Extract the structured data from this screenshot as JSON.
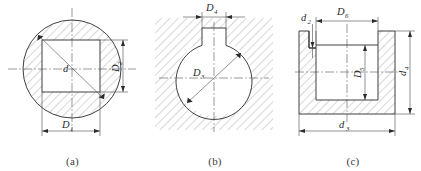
{
  "sheet": {
    "title": "Cross-sectional engineering drawings",
    "background_color": "#ffffff",
    "line_color": "#2b2b2b",
    "hatch_color": "#6e6e6e",
    "dimension_color": "#4a4a4a"
  },
  "figures": [
    {
      "id": "a",
      "caption": "(a)",
      "description": "Hatched circular section with a central square hole, centerlines crossing and a diagonal radius indicator",
      "dimensions": [
        {
          "name": "D1",
          "letter": "D",
          "subscript": "1",
          "position": "bottom",
          "measures": "square-hole-width"
        },
        {
          "name": "D2",
          "letter": "D",
          "subscript": "2",
          "position": "right",
          "measures": "square-hole-height"
        },
        {
          "name": "d",
          "letter": "d",
          "subscript": "",
          "position": "center",
          "measures": "diagonal"
        }
      ]
    },
    {
      "id": "b",
      "caption": "(b)",
      "description": "Hatched block with a circular bore and a rectangular keyway slot opening at the top",
      "dimensions": [
        {
          "name": "D4",
          "letter": "D",
          "subscript": "4",
          "position": "top",
          "measures": "keyway-width"
        },
        {
          "name": "D3",
          "letter": "D",
          "subscript": "3",
          "position": "center",
          "measures": "bore-diameter"
        }
      ]
    },
    {
      "id": "c",
      "caption": "(c)",
      "description": "Hatched U-shaped cross-section (sectional elevation) with inner cavity and a narrow step groove at upper left",
      "dimensions": [
        {
          "name": "d2",
          "letter": "d",
          "subscript": "2",
          "position": "top-left",
          "measures": "groove-width"
        },
        {
          "name": "D6",
          "letter": "D",
          "subscript": "6",
          "position": "top",
          "measures": "cavity-opening-width"
        },
        {
          "name": "D5",
          "letter": "D",
          "subscript": "5",
          "position": "inner",
          "measures": "cavity-depth"
        },
        {
          "name": "d4",
          "letter": "d",
          "subscript": "4",
          "position": "right",
          "measures": "overall-height"
        },
        {
          "name": "d3",
          "letter": "d",
          "subscript": "3",
          "position": "bottom",
          "measures": "overall-width"
        }
      ]
    }
  ]
}
